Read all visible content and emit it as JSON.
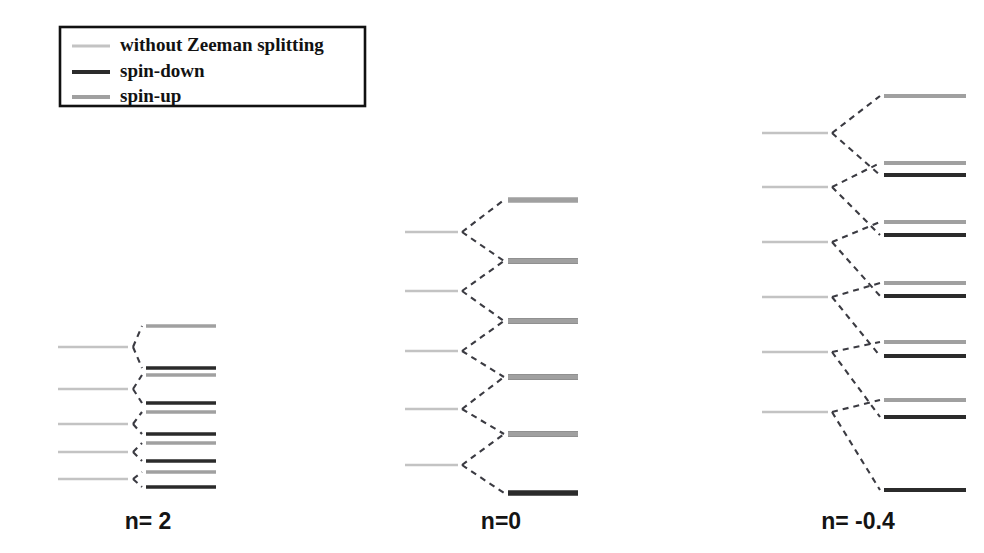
{
  "figure": {
    "background_color": "#ffffff",
    "width": 984,
    "height": 553
  },
  "colors": {
    "unsplit": "#c3c3c3",
    "spin_down": "#2b2b2b",
    "spin_up": "#a0a0a0",
    "connector": "#3b3b42",
    "legend_border": "#111111",
    "text": "#121212"
  },
  "legend": {
    "box": {
      "x": 60,
      "y": 27,
      "width": 305,
      "height": 79
    },
    "swatch": {
      "x1": 72,
      "x2": 110,
      "label_x": 120
    },
    "items": [
      {
        "label": "without Zeeman splitting",
        "color_key": "unsplit",
        "thickness": 3.0,
        "y": 46
      },
      {
        "label": "spin-down",
        "color_key": "spin_down",
        "thickness": 4.2,
        "y": 72
      },
      {
        "label": "spin-up",
        "color_key": "spin_up",
        "thickness": 4.2,
        "y": 97
      }
    ]
  },
  "chart_data": {
    "type": "diagram",
    "legend_entries": [
      "without Zeeman splitting",
      "spin-down",
      "spin-up"
    ],
    "panels": [
      {
        "label": "n= 2",
        "label_x": 148,
        "label_y": 523,
        "source_x1": 58,
        "source_x2": 128,
        "vertex_x": 133,
        "split_x1": 146,
        "split_x2": 216,
        "source_thickness": 2.6,
        "split_thickness": 3.6,
        "levels": [
          {
            "source_y": 347,
            "up_y": 326,
            "down_y": 368
          },
          {
            "source_y": 389,
            "up_y": 375,
            "down_y": 403
          },
          {
            "source_y": 424,
            "up_y": 412,
            "down_y": 434
          },
          {
            "source_y": 452,
            "up_y": 443,
            "down_y": 461
          },
          {
            "source_y": 479,
            "up_y": 472,
            "down_y": 487
          }
        ]
      },
      {
        "label": "n=0",
        "label_x": 501,
        "label_y": 523,
        "source_x1": 405,
        "source_x2": 458,
        "vertex_x": 462,
        "split_x1": 508,
        "split_x2": 578,
        "source_thickness": 2.6,
        "split_thickness": 5.6,
        "levels": [
          {
            "source_y": 232,
            "up_y": 200,
            "down_y": 261
          },
          {
            "source_y": 291,
            "up_y": 261,
            "down_y": 321
          },
          {
            "source_y": 351,
            "up_y": 321,
            "down_y": 377
          },
          {
            "source_y": 409,
            "up_y": 377,
            "down_y": 434
          },
          {
            "source_y": 465,
            "up_y": 434,
            "down_y": 493
          }
        ]
      },
      {
        "label": "n= -0.4",
        "label_x": 858,
        "label_y": 523,
        "source_x1": 762,
        "source_x2": 828,
        "vertex_x": 832,
        "split_x1": 884,
        "split_x2": 966,
        "source_thickness": 2.6,
        "split_thickness": 4.2,
        "levels": [
          {
            "source_y": 133,
            "up_y": 96,
            "down_y": 175
          },
          {
            "source_y": 187,
            "up_y": 163,
            "down_y": 235
          },
          {
            "source_y": 242,
            "up_y": 222,
            "down_y": 296
          },
          {
            "source_y": 297,
            "up_y": 283,
            "down_y": 356
          },
          {
            "source_y": 352,
            "up_y": 342,
            "down_y": 417
          },
          {
            "source_y": 412,
            "up_y": 400,
            "down_y": 490
          }
        ]
      }
    ]
  }
}
